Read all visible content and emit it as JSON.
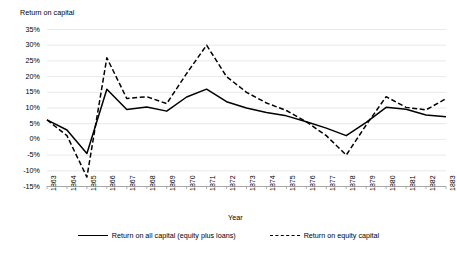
{
  "chart_data": {
    "type": "line",
    "title": "",
    "ylabel": "Return on capital",
    "xlabel": "Year",
    "grid": true,
    "legend_position": "bottom",
    "ylim": [
      -15,
      35
    ],
    "ytick_labels": [
      "35%",
      "30%",
      "25%",
      "20%",
      "15%",
      "10%",
      "5%",
      "0%",
      "-5%",
      "-10%",
      "-15%"
    ],
    "ytick_values": [
      35,
      30,
      25,
      20,
      15,
      10,
      5,
      0,
      -5,
      -10,
      -15
    ],
    "categories": [
      "1863",
      "1864",
      "1865",
      "1866",
      "1867",
      "1868",
      "1869",
      "1870",
      "1871",
      "1872",
      "1873",
      "1874",
      "1875",
      "1876",
      "1877",
      "1878",
      "1879",
      "1880",
      "1881",
      "1882",
      "1883"
    ],
    "series": [
      {
        "name": "Return on all capital (equity plus loans)",
        "style": "solid",
        "values": [
          6.2,
          3.0,
          -4.5,
          16.0,
          9.5,
          10.3,
          9.0,
          13.5,
          16.0,
          12.0,
          10.0,
          8.6,
          7.5,
          5.6,
          3.6,
          1.2,
          5.4,
          10.2,
          9.6,
          7.8,
          7.2
        ]
      },
      {
        "name": "Return on equity capital",
        "style": "dashed",
        "values": [
          6.2,
          1.2,
          -12.0,
          26.0,
          13.0,
          13.6,
          11.4,
          21.0,
          30.0,
          20.0,
          15.0,
          11.6,
          9.2,
          5.6,
          1.2,
          -5.0,
          4.6,
          13.6,
          10.2,
          9.4,
          13.0
        ]
      }
    ]
  },
  "legend": {
    "items": [
      {
        "label": "Return on all capital (equity plus loans)",
        "style": "solid"
      },
      {
        "label": "Return on equity capital",
        "style": "dashed"
      }
    ]
  }
}
